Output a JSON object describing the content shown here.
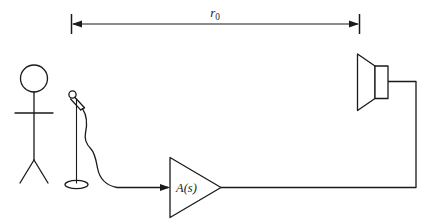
{
  "figure": {
    "colors": {
      "ink": "#1a1a1a",
      "background": "#ffffff"
    },
    "dimension": {
      "label_base": "r",
      "label_subscript": "0",
      "label_full": "r0",
      "from_x": 71,
      "to_x": 360,
      "y": 24
    },
    "amplifier": {
      "label_base": "A",
      "label_args": "(s)",
      "label_full": "A(s)"
    },
    "parts": {
      "listener": "stick-figure-listener",
      "microphone": "microphone-on-stand",
      "cable": "microphone-cable",
      "amp": "amplifier-triangle",
      "speaker": "loudspeaker",
      "speaker_wire": "speaker-wire"
    }
  }
}
